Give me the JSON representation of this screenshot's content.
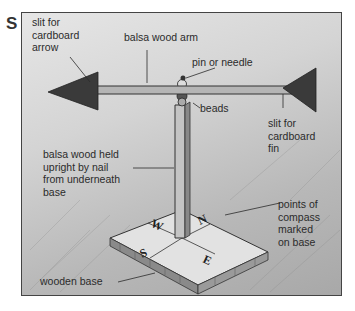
{
  "figure": {
    "panel_letter": "S",
    "labels": {
      "slit_arrow": "slit for\ncardboard\narrow",
      "arm": "balsa wood arm",
      "pin": "pin or needle",
      "beads": "beads",
      "slit_fin": "slit for\ncardboard\nfin",
      "upright": "balsa wood held\nupright by nail\nfrom underneath\nbase",
      "compass": "points of\ncompass\nmarked\non base",
      "base": "wooden base"
    },
    "compass_points": {
      "north": "N",
      "south": "S",
      "east": "E",
      "west": "W"
    },
    "colors": {
      "ink": "#2b2b2b",
      "cardboard": "#3a3a3a",
      "wood": "#bdbdbd",
      "base_top": "#e2e2e2"
    }
  }
}
